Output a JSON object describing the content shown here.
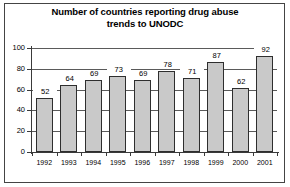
{
  "figure": {
    "width": 290,
    "height": 187,
    "background": "#ffffff",
    "frame_color": "#444444"
  },
  "chart_data": {
    "type": "bar",
    "title": "Number of countries reporting drug abuse trends to UNODC",
    "title_line1": "Number of countries reporting drug abuse",
    "title_line2": "trends to UNODC",
    "xlabel": "",
    "ylabel": "",
    "categories": [
      "1992",
      "1993",
      "1994",
      "1995",
      "1996",
      "1997",
      "1998",
      "1999",
      "2000",
      "2001"
    ],
    "values": [
      52,
      64,
      69,
      73,
      69,
      78,
      71,
      87,
      62,
      92
    ],
    "ylim": [
      0,
      100
    ],
    "yticks": [
      0,
      20,
      40,
      60,
      80,
      100
    ],
    "ytick_labels": [
      "0",
      "20",
      "40",
      "60",
      "80",
      "100"
    ],
    "data_labels": [
      "52",
      "64",
      "69",
      "73",
      "69",
      "78",
      "71",
      "87",
      "62",
      "92"
    ],
    "grid": true,
    "legend": false,
    "bar_color": "#c9c9c9",
    "bar_edge_color": "#2e2e2e",
    "grid_color": "#5a5a5a",
    "axis_color": "#3a3a3a",
    "text_color": "#000000"
  }
}
